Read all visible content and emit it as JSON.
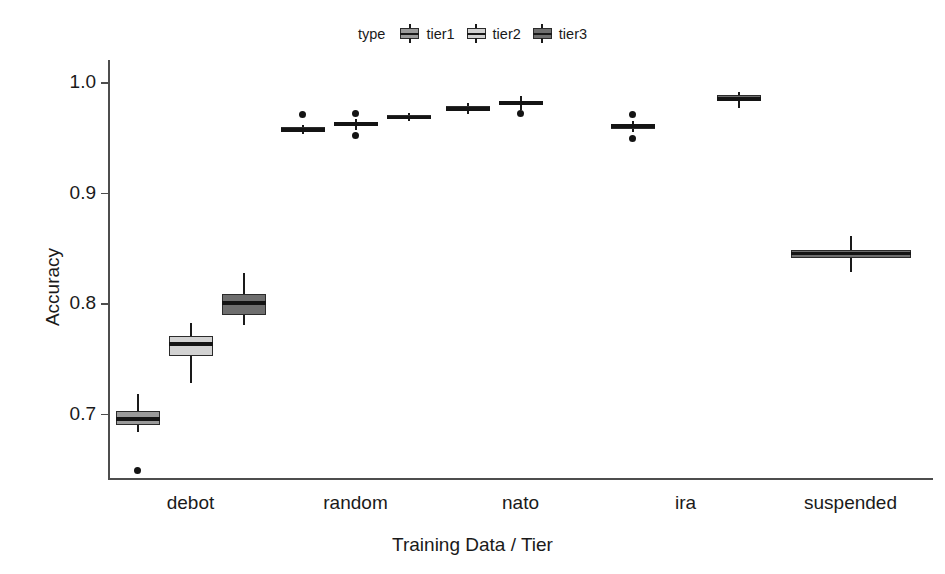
{
  "legend": {
    "title": "type",
    "items": [
      {
        "label": "tier1",
        "color": "#9a9a9a"
      },
      {
        "label": "tier2",
        "color": "#d2d2d2"
      },
      {
        "label": "tier3",
        "color": "#6e6e6e"
      }
    ]
  },
  "axes": {
    "ylabel": "Accuracy",
    "xlabel": "Training Data / Tier",
    "yticks": [
      "0.7",
      "0.8",
      "0.9",
      "1.0"
    ],
    "ytick_values": [
      0.7,
      0.8,
      0.9,
      1.0
    ],
    "ylim": [
      0.64,
      1.02
    ],
    "xcategories": [
      "debot",
      "random",
      "nato",
      "ira",
      "suspended"
    ]
  },
  "chart_data": {
    "type": "box",
    "title": "",
    "xlabel": "Training Data / Tier",
    "ylabel": "Accuracy",
    "ylim": [
      0.64,
      1.02
    ],
    "yticks": [
      0.7,
      0.8,
      0.9,
      1.0
    ],
    "grid": false,
    "legend_position": "top",
    "legend_title": "type",
    "categories": [
      "debot",
      "random",
      "nato",
      "ira",
      "suspended"
    ],
    "series": [
      {
        "name": "tier1",
        "color": "#9a9a9a",
        "boxes": [
          {
            "category": "debot",
            "whisker_low": 0.683,
            "q1": 0.69,
            "median": 0.695,
            "q3": 0.702,
            "whisker_high": 0.718,
            "outliers": [
              0.649
            ]
          },
          {
            "category": "random",
            "whisker_low": 0.953,
            "q1": 0.956,
            "median": 0.957,
            "q3": 0.959,
            "whisker_high": 0.961,
            "outliers": [
              0.971
            ]
          },
          {
            "category": "nato",
            "whisker_low": 0.971,
            "q1": 0.974,
            "median": 0.976,
            "q3": 0.978,
            "whisker_high": 0.981,
            "outliers": []
          },
          {
            "category": "ira",
            "whisker_low": 0.955,
            "q1": 0.958,
            "median": 0.96,
            "q3": 0.962,
            "whisker_high": 0.965,
            "outliers": [
              0.971,
              0.949
            ]
          },
          {
            "category": "suspended",
            "whisker_low": null,
            "q1": null,
            "median": null,
            "q3": null,
            "whisker_high": null,
            "outliers": []
          }
        ]
      },
      {
        "name": "tier2",
        "color": "#d2d2d2",
        "boxes": [
          {
            "category": "debot",
            "whisker_low": 0.728,
            "q1": 0.752,
            "median": 0.763,
            "q3": 0.77,
            "whisker_high": 0.782,
            "outliers": []
          },
          {
            "category": "random",
            "whisker_low": 0.957,
            "q1": 0.96,
            "median": 0.962,
            "q3": 0.964,
            "whisker_high": 0.967,
            "outliers": [
              0.972,
              0.952
            ]
          },
          {
            "category": "nato",
            "whisker_low": 0.975,
            "q1": 0.979,
            "median": 0.981,
            "q3": 0.982,
            "whisker_high": 0.987,
            "outliers": [
              0.972
            ]
          },
          {
            "category": "ira",
            "whisker_low": null,
            "q1": null,
            "median": null,
            "q3": null,
            "whisker_high": null,
            "outliers": []
          },
          {
            "category": "suspended",
            "whisker_low": null,
            "q1": null,
            "median": null,
            "q3": null,
            "whisker_high": null,
            "outliers": []
          }
        ]
      },
      {
        "name": "tier3",
        "color": "#6e6e6e",
        "boxes": [
          {
            "category": "debot",
            "whisker_low": 0.78,
            "q1": 0.789,
            "median": 0.8,
            "q3": 0.808,
            "whisker_high": 0.827,
            "outliers": []
          },
          {
            "category": "random",
            "whisker_low": 0.965,
            "q1": 0.967,
            "median": 0.968,
            "q3": 0.97,
            "whisker_high": 0.972,
            "outliers": []
          },
          {
            "category": "nato",
            "whisker_low": null,
            "q1": null,
            "median": null,
            "q3": null,
            "whisker_high": null,
            "outliers": []
          },
          {
            "category": "ira",
            "whisker_low": 0.977,
            "q1": 0.983,
            "median": 0.985,
            "q3": 0.988,
            "whisker_high": 0.991,
            "outliers": []
          },
          {
            "category": "suspended",
            "whisker_low": 0.828,
            "q1": 0.841,
            "median": 0.845,
            "q3": 0.848,
            "whisker_high": 0.861,
            "outliers": []
          }
        ]
      }
    ]
  }
}
